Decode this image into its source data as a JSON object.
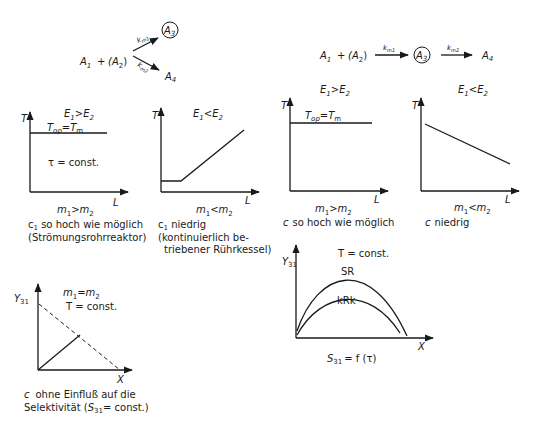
{
  "scheme_parallel": {
    "reactant": "A",
    "reactant_sub": "1",
    "plus": "+",
    "coreactant": "(A",
    "coreactant_sub": "2",
    "coreactant_close": ")",
    "k1": "k",
    "k1_sub": "m1",
    "k2": "k",
    "k2_sub": "m2",
    "product_desired": "A",
    "product_desired_sub": "3",
    "product_side": "A",
    "product_side_sub": "4"
  },
  "scheme_series": {
    "reactant": "A",
    "reactant_sub": "1",
    "plus": "+",
    "coreactant": "(A",
    "coreactant_sub": "2",
    "coreactant_close": ")",
    "k1": "k",
    "k1_sub": "m1",
    "k2": "k",
    "k2_sub": "m2",
    "intermediate": "A",
    "intermediate_sub": "3",
    "product": "A",
    "product_sub": "4"
  },
  "panels": [
    {
      "id": "p1",
      "title": "E1 > E2",
      "y_axis": "T",
      "x_axis": "L",
      "annotation": "Top = Tm",
      "annotation2": "τ = const.",
      "condition": "m1 > m2",
      "caption_lines": [
        "c1 so hoch wie möglich",
        "(Strömungsrohrreaktor)"
      ]
    },
    {
      "id": "p2",
      "title": "E1 < E2",
      "y_axis": "T",
      "x_axis": "L",
      "condition": "m1 < m2",
      "caption_lines": [
        "c1 niedrig",
        "(kontinuierlich be-",
        "triebener Rührkessel)"
      ]
    },
    {
      "id": "p3",
      "title": "E1 > E2",
      "y_axis": "T",
      "x_axis": "L",
      "annotation": "Top = Tm",
      "condition": "m1 > m2",
      "caption_lines": [
        "c so hoch wie möglich"
      ]
    },
    {
      "id": "p4",
      "title": "E1 < E2",
      "y_axis": "T",
      "x_axis": "L",
      "condition": "m1 < m2",
      "caption_lines": [
        "c niedrig"
      ]
    },
    {
      "id": "p5",
      "title": "m1 = m2",
      "subtitle": "T = const.",
      "y_axis": "Y31",
      "x_axis": "X",
      "caption_lines": [
        "c ohne Einfluß auf die",
        "Selektivität (S31 = const.)"
      ]
    },
    {
      "id": "p6",
      "title": "T = const.",
      "y_axis": "Y31",
      "x_axis": "X",
      "curve_labels": [
        "SR",
        "kRk"
      ],
      "caption_lines": [
        "S31 = f (τ)"
      ]
    }
  ],
  "text": {
    "E": "E",
    "s1": "1",
    "s2": "2",
    "gt": ">",
    "lt": "<",
    "T": "T",
    "L": "L",
    "Top": "T",
    "op": "op",
    "eq": "=",
    "Tm": "T",
    "m": "m",
    "tau_const": "τ = const.",
    "X": "X",
    "Y": "Y",
    "s31": "31",
    "T_const": "T = const.",
    "SR": "SR",
    "kRk": "kRk",
    "S": "S",
    "f_tau": "= f (τ)",
    "c": "c",
    "c1_hoch": " so hoch wie möglich",
    "c1_hoch_paren": "(Strömungsrohrreaktor)",
    "c1_niedrig": " niedrig",
    "kont1": "(kontinuierlich be-",
    "kont2": "triebener Rührkessel)",
    "c_hoch": "so hoch wie möglich",
    "c_niedrig": "niedrig",
    "ohne": "ohne Einfluß auf die",
    "selek": "Selektivität  (",
    "selek_const": "= const.)"
  }
}
